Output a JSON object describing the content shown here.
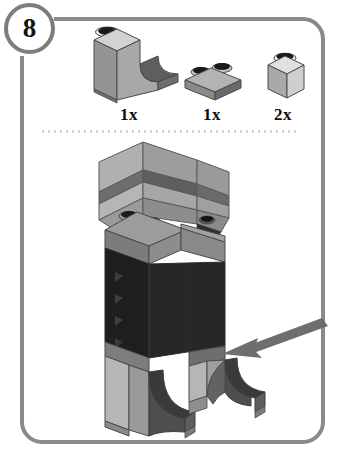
{
  "document": {
    "kind": "lego-building-instruction-step",
    "step_number": "8"
  },
  "frame": {
    "border_color": "#8a8a8a",
    "background_color": "#ffffff"
  },
  "step_badge": {
    "label": "8",
    "border_color": "#7d7d7d"
  },
  "parts_bin": {
    "divider": "dotted",
    "parts": [
      {
        "name": "curved-bow-brick",
        "description": "1x3x2 curved slope brick",
        "quantity_label": "1x",
        "color": "#9a9a9a"
      },
      {
        "name": "plate-1x2",
        "description": "1x2 plate",
        "quantity_label": "1x",
        "color": "#8e8e8e"
      },
      {
        "name": "brick-1x1",
        "description": "1x1 brick",
        "quantity_label": "2x",
        "color": "#b9b9b9"
      }
    ]
  },
  "assembly": {
    "name": "model-assembly-figure",
    "description": "Partially built figure: light gray head block, gray 1x2 plate with two studs, dark body, two curved legs",
    "arrow": {
      "name": "placement-arrow",
      "direction": "left",
      "color": "#6e6e6e"
    },
    "colors": {
      "light_gray": "#b4b4b4",
      "mid_gray": "#8c8c8c",
      "dark_gray": "#5c5c5c",
      "black": "#1c1c1c",
      "stud_black": "#1a1a1a",
      "outline": "#4a4a4a"
    }
  }
}
